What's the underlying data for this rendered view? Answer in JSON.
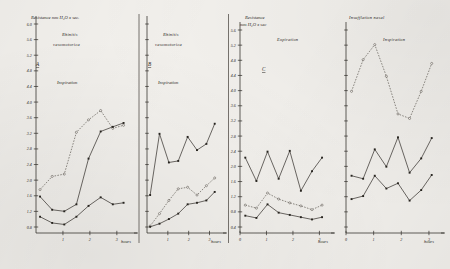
{
  "figure": {
    "background_color": "#f4f2ee",
    "ink_color": "#2a2723"
  },
  "panels": [
    {
      "id": "A",
      "letter": "A",
      "group_title_line1": "Rhinitis",
      "group_title_line2": "vasomotorica",
      "phase": "Inspiration",
      "y_axis_label_line1": "Resistance mm H₂O x sec.",
      "y_axis_label_line2": "",
      "x_axis_label": "hours",
      "x_ticks": [
        "1",
        "2",
        "3"
      ],
      "y_ticks": [
        "6.0",
        "5.6",
        "5.2",
        "4.8",
        "4.4",
        "4.0",
        "3.6",
        "3.2",
        "2.8",
        "2.4",
        "2.0",
        "1.6",
        "1.2",
        "0.8"
      ]
    },
    {
      "id": "B",
      "letter": "B",
      "group_title_line1": "Rhinitis",
      "group_title_line2": "vasomotorica",
      "phase": "Inspiration",
      "y_axis_label_line1": "",
      "y_axis_label_line2": "",
      "x_axis_label": "hours",
      "x_ticks": [
        "1",
        "2",
        "3"
      ],
      "y_ticks": []
    },
    {
      "id": "C",
      "letter": "C",
      "group_title_line1": "Insufflation nasal",
      "group_title_line2": "",
      "phase": "Expiration",
      "y_axis_label_line1": "Resistance",
      "y_axis_label_line2": "mm H₂O x sec",
      "x_axis_label": "hours",
      "x_ticks": [
        "0",
        "1",
        "2",
        "3"
      ],
      "y_ticks": [
        "5.6",
        "5.2",
        "4.8",
        "4.4",
        "4.0",
        "3.6",
        "3.2",
        "2.8",
        "2.4",
        "2.0",
        "1.6",
        "1.2",
        "0.8",
        "0.4"
      ]
    },
    {
      "id": "D",
      "letter": "D",
      "group_title_line1": "",
      "group_title_line2": "",
      "phase": "Inspiration",
      "y_axis_label_line1": "",
      "y_axis_label_line2": "",
      "x_axis_label": "hours",
      "x_ticks": [
        "0",
        "1",
        "2",
        "3"
      ],
      "y_ticks": []
    }
  ],
  "headers": {
    "left_group": "Rhinitis vasomotorica",
    "right_group": "Insufflation nasal"
  },
  "chart_data": [
    {
      "type": "line",
      "panel": "A",
      "title": "Rhinitis vasomotorica",
      "subtitle": "Inspiration",
      "xlabel": "hours",
      "ylabel": "Resistance mm H2O x sec.",
      "xlim": [
        0,
        3.6
      ],
      "ylim": [
        0.6,
        6.2
      ],
      "grid": false,
      "legend": "none",
      "x": [
        0.15,
        0.6,
        1.05,
        1.5,
        1.95,
        2.4,
        2.85,
        3.25
      ],
      "series": [
        {
          "name": "upper-dotted",
          "style": "dotted",
          "marker": "open",
          "values": [
            1.72,
            2.06,
            2.12,
            3.2,
            3.52,
            3.76,
            3.3,
            3.38
          ]
        },
        {
          "name": "middle-solid",
          "style": "solid",
          "marker": "filled",
          "values": [
            1.54,
            1.2,
            1.16,
            1.34,
            2.52,
            3.22,
            3.34,
            3.44
          ]
        },
        {
          "name": "lower-solid",
          "style": "solid",
          "marker": "filled",
          "values": [
            1.02,
            0.86,
            0.82,
            1.02,
            1.3,
            1.52,
            1.34,
            1.38
          ]
        }
      ]
    },
    {
      "type": "line",
      "panel": "B",
      "title": "Rhinitis vasomotorica",
      "subtitle": "Inspiration",
      "xlabel": "hours",
      "ylabel": "",
      "xlim": [
        0,
        3.6
      ],
      "ylim": [
        0.6,
        6.2
      ],
      "grid": false,
      "legend": "none",
      "x": [
        0.15,
        0.6,
        1.05,
        1.5,
        1.95,
        2.4,
        2.85,
        3.25
      ],
      "series": [
        {
          "name": "upper-solid",
          "style": "solid",
          "marker": "filled",
          "values": [
            1.58,
            3.16,
            2.42,
            2.46,
            3.08,
            2.74,
            2.9,
            3.42
          ]
        },
        {
          "name": "middle-dotted",
          "style": "dotted",
          "marker": "open",
          "values": [
            0.78,
            1.1,
            1.44,
            1.74,
            1.78,
            1.58,
            1.82,
            2.02
          ]
        },
        {
          "name": "lower-solid",
          "style": "solid",
          "marker": "filled",
          "values": [
            0.76,
            0.84,
            0.96,
            1.1,
            1.34,
            1.38,
            1.44,
            1.66
          ]
        }
      ]
    },
    {
      "type": "line",
      "panel": "C",
      "title": "Insufflation nasal",
      "subtitle": "Expiration",
      "xlabel": "hours",
      "ylabel": "Resistance mm H2O x sec",
      "xlim": [
        0,
        3.4
      ],
      "ylim": [
        0.2,
        5.8
      ],
      "grid": false,
      "legend": "none",
      "x": [
        0.2,
        0.62,
        1.04,
        1.46,
        1.88,
        2.3,
        2.72,
        3.1
      ],
      "series": [
        {
          "name": "upper-solid",
          "style": "solid",
          "marker": "filled",
          "values": [
            2.2,
            1.58,
            2.36,
            1.64,
            2.38,
            1.32,
            1.84,
            2.2
          ]
        },
        {
          "name": "middle-dotted",
          "style": "dotted",
          "marker": "open",
          "values": [
            0.94,
            0.86,
            1.26,
            1.1,
            1.0,
            0.92,
            0.82,
            0.94
          ]
        },
        {
          "name": "lower-solid",
          "style": "solid",
          "marker": "filled",
          "values": [
            0.66,
            0.6,
            0.96,
            0.74,
            0.68,
            0.62,
            0.56,
            0.62
          ]
        }
      ]
    },
    {
      "type": "line",
      "panel": "D",
      "title": "Insufflation nasal",
      "subtitle": "Inspiration",
      "xlabel": "hours",
      "ylabel": "",
      "xlim": [
        0,
        3.4
      ],
      "ylim": [
        0.2,
        5.8
      ],
      "grid": false,
      "legend": "none",
      "x": [
        0.2,
        0.62,
        1.04,
        1.46,
        1.88,
        2.3,
        2.72,
        3.1
      ],
      "series": [
        {
          "name": "upper-dotted",
          "style": "dotted",
          "marker": "open",
          "values": [
            3.96,
            4.8,
            5.2,
            4.36,
            3.36,
            3.24,
            3.96,
            4.7
          ]
        },
        {
          "name": "middle-solid",
          "style": "solid",
          "marker": "filled",
          "values": [
            1.72,
            1.64,
            2.42,
            1.96,
            2.74,
            1.8,
            2.18,
            2.72
          ]
        },
        {
          "name": "lower-solid",
          "style": "solid",
          "marker": "filled",
          "values": [
            1.1,
            1.18,
            1.72,
            1.38,
            1.52,
            1.06,
            1.34,
            1.74
          ]
        }
      ]
    }
  ]
}
